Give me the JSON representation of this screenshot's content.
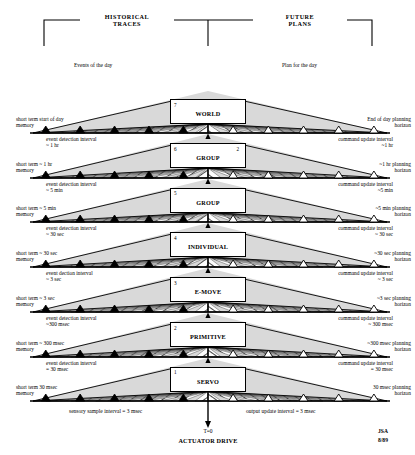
{
  "header": {
    "left_label": "HISTORICAL\nTRACES",
    "left_line1": "HISTORICAL",
    "left_line2": "TRACES",
    "right_line1": "FUTURE",
    "right_line2": "PLANS"
  },
  "top_annotations": {
    "left": "Events of the day",
    "right": "Plan for the day"
  },
  "bottom": {
    "sensory": "sensory sample interval = 3 msec",
    "output": "output update interval = 3 msec",
    "t_zero": "T=0",
    "actuator": "ACTUATOR DRIVE",
    "signature_name": "JSA",
    "signature_date": "8/89"
  },
  "colors": {
    "line": "#000000",
    "shade": "#d9d9d9",
    "paper": "#ffffff",
    "past_marker": "#000000",
    "future_marker": "#ffffff"
  },
  "levels": [
    {
      "number": "7",
      "name": "WORLD",
      "corner": "",
      "memory_label_1": "short term start of day",
      "memory_label_2": "memory",
      "horizon_label_1": "End of day planning",
      "horizon_label_2": "horizon",
      "event_interval_1": "event detection interval",
      "event_interval_2": "~ 1 hr",
      "command_interval_1": "command update interval",
      "command_interval_2": "~1 hr"
    },
    {
      "number": "6",
      "name": "GROUP",
      "corner": "2",
      "memory_label_1": "short term ~ 1 hr",
      "memory_label_2": "memory",
      "horizon_label_1": "~1 hr planning",
      "horizon_label_2": "horizon",
      "event_interval_1": "event detection interval",
      "event_interval_2": "~ 5 min",
      "command_interval_1": "command update interval",
      "command_interval_2": "~5 min"
    },
    {
      "number": "5",
      "name": "GROUP",
      "corner": "",
      "memory_label_1": "short term ~ 5 min",
      "memory_label_2": "memory",
      "horizon_label_1": "~5 min planning",
      "horizon_label_2": "horizon",
      "event_interval_1": "event detection interval",
      "event_interval_2": "~ 30 sec",
      "command_interval_1": "command update interval",
      "command_interval_2": "~ 30 sec"
    },
    {
      "number": "4",
      "name": "INDIVIDUAL",
      "corner": "",
      "memory_label_1": "short term ~ 30 sec",
      "memory_label_2": "memory",
      "horizon_label_1": "~30 sec planning",
      "horizon_label_2": "horizon",
      "event_interval_1": "event dection interval",
      "event_interval_2": "~ 3 sec",
      "command_interval_1": "command update interval",
      "command_interval_2": "~ 3 sec"
    },
    {
      "number": "3",
      "name": "E-MOVE",
      "corner": "",
      "memory_label_1": "short term ~ 3 sec",
      "memory_label_2": "memory",
      "horizon_label_1": "~3 sec planning",
      "horizon_label_2": "horizon",
      "event_interval_1": "event detection interval",
      "event_interval_2": "~300 msec",
      "command_interval_1": "command update interval",
      "command_interval_2": "~ 300 msec"
    },
    {
      "number": "2",
      "name": "PRIMITIVE",
      "corner": "",
      "memory_label_1": "short term ~ 300 msec",
      "memory_label_2": "memory",
      "horizon_label_1": "~300 msec planning",
      "horizon_label_2": "horizon",
      "event_interval_1": "event detection interval",
      "event_interval_2": "= 30 msec",
      "command_interval_1": "command update interval",
      "command_interval_2": "= 30 msec"
    },
    {
      "number": "1",
      "name": "SERVO",
      "corner": "",
      "memory_label_1": "short term 30 msec",
      "memory_label_2": "memory",
      "horizon_label_1": "30 msec planning",
      "horizon_label_2": "horizon",
      "event_interval_1": "",
      "event_interval_2": "",
      "command_interval_1": "",
      "command_interval_2": ""
    }
  ],
  "geometry": {
    "axes_y": [
      90,
      133,
      178,
      222,
      267,
      312,
      357,
      401
    ],
    "center_x": 208,
    "left_end": 30,
    "right_end": 390,
    "box_w": 76,
    "box_h": 25
  }
}
